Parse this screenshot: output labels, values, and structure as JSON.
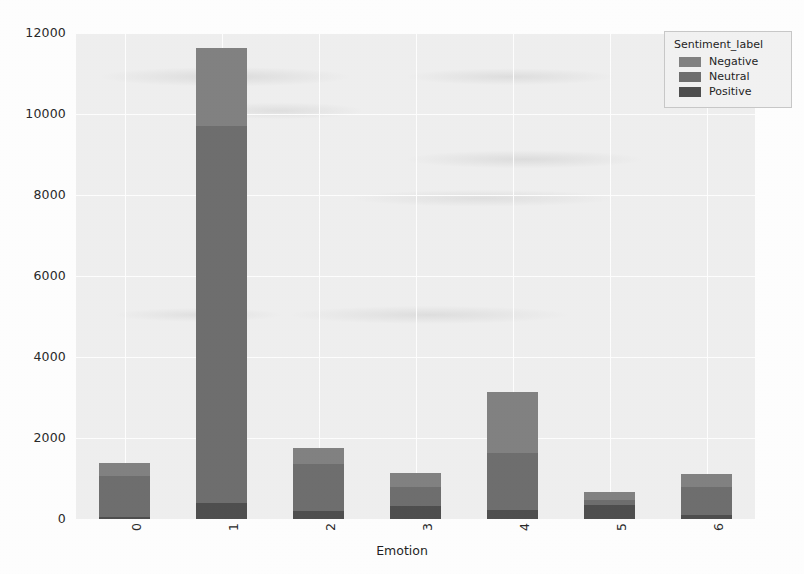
{
  "chart_data": {
    "type": "bar",
    "variant": "stacked-vertical",
    "title": "",
    "xlabel": "Emotion",
    "ylabel": "",
    "categories": [
      "0",
      "1",
      "2",
      "3",
      "4",
      "5",
      "6"
    ],
    "series": [
      {
        "name": "Positive",
        "color": "#4f4f4f",
        "values": [
          60,
          400,
          200,
          330,
          230,
          340,
          100
        ]
      },
      {
        "name": "Neutral",
        "color": "#6f6f6f",
        "values": [
          1000,
          9300,
          1150,
          450,
          1400,
          130,
          700
        ]
      },
      {
        "name": "Negative",
        "color": "#828282",
        "values": [
          320,
          1930,
          410,
          350,
          1500,
          190,
          300
        ]
      }
    ],
    "stack_order_bottom_to_top": [
      "Positive",
      "Neutral",
      "Negative"
    ],
    "totals": [
      1380,
      11630,
      1760,
      1130,
      3130,
      660,
      1100
    ],
    "ylim": [
      0,
      12000
    ],
    "yticks": [
      0,
      2000,
      4000,
      6000,
      8000,
      10000,
      12000
    ],
    "ytick_labels": [
      "0",
      "2000",
      "4000",
      "6000",
      "8000",
      "10000",
      "12000"
    ],
    "xtick_labels": [
      "0",
      "1",
      "2",
      "3",
      "4",
      "5",
      "6"
    ],
    "xtick_rotation": 90,
    "grid": true,
    "grid_color": "#ffffff",
    "plot_background": "#f0f0f0",
    "figure_background": "#ffffff",
    "legend_position": "upper right"
  },
  "legend": {
    "title": "Sentiment_label",
    "entries": [
      {
        "label": "Negative",
        "color": "#828282"
      },
      {
        "label": "Neutral",
        "color": "#6f6f6f"
      },
      {
        "label": "Positive",
        "color": "#4f4f4f"
      }
    ]
  },
  "axes": {
    "xlabel": "Emotion"
  }
}
